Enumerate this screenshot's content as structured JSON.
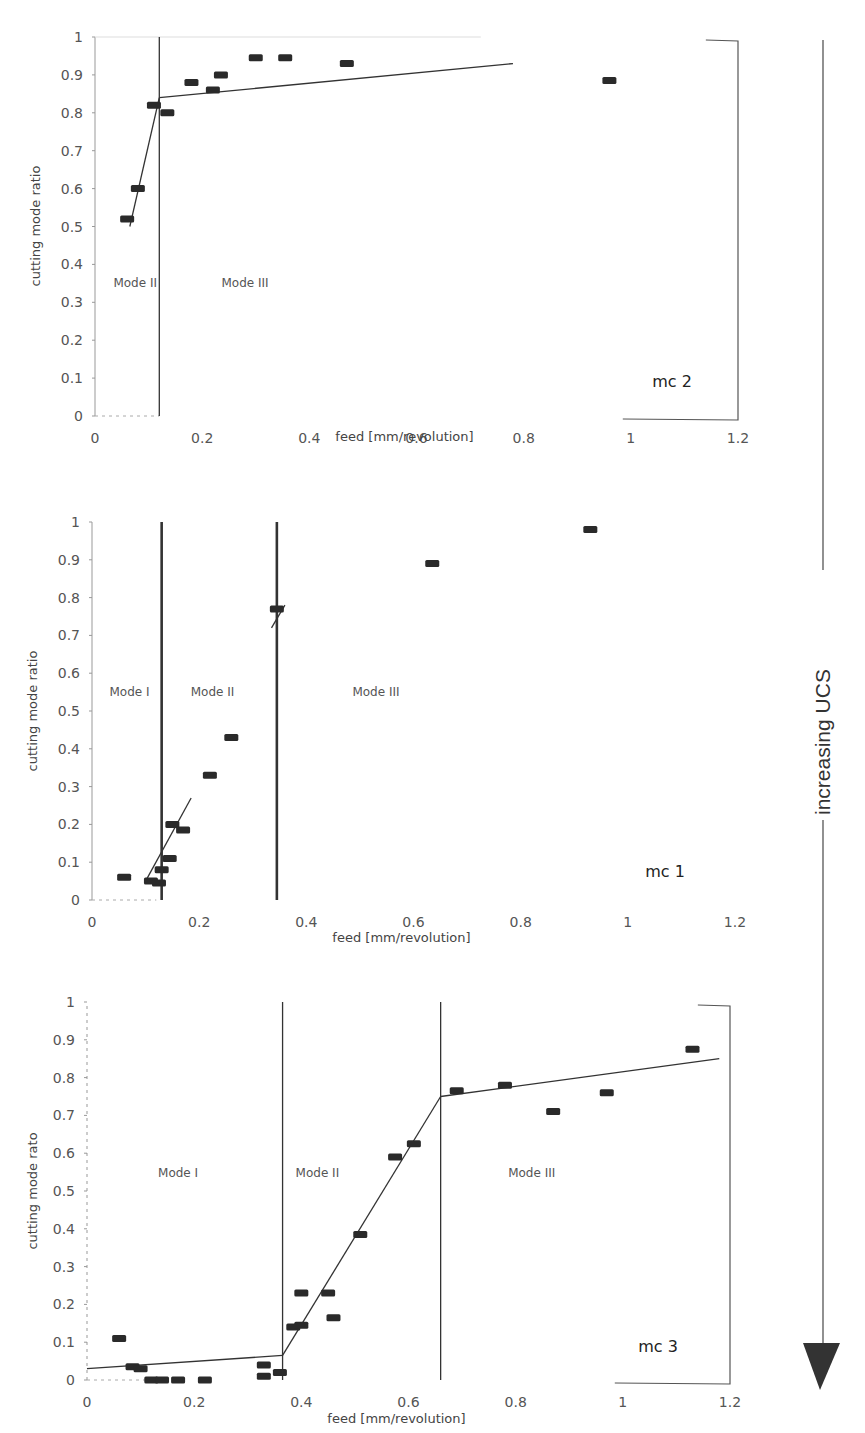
{
  "header_fragment": "... ity ... ing ... y ...",
  "side_arrow": {
    "label": "increasing UCS",
    "direction": "down"
  },
  "chart_data": [
    {
      "id": "mc2",
      "type": "scatter",
      "title": "mc 2",
      "xlabel": "feed [mm/revolution]",
      "ylabel": "cutting mode ratio",
      "xlim": [
        0,
        1.2
      ],
      "ylim": [
        0,
        1
      ],
      "x_ticks": [
        "0",
        "0.2",
        "0.4",
        "0.6",
        "0.8",
        "1",
        "1.2"
      ],
      "y_ticks": [
        "0",
        "0.1",
        "0.2",
        "0.3",
        "0.4",
        "0.5",
        "0.6",
        "0.7",
        "0.8",
        "0.9",
        "1"
      ],
      "grid": false,
      "mode_boundaries": [
        0.12
      ],
      "mode_labels": [
        {
          "text": "Mode II",
          "x": 0.075,
          "y": 0.35
        },
        {
          "text": "Mode III",
          "x": 0.28,
          "y": 0.35
        }
      ],
      "points": [
        {
          "x": 0.06,
          "y": 0.52
        },
        {
          "x": 0.08,
          "y": 0.6
        },
        {
          "x": 0.11,
          "y": 0.82
        },
        {
          "x": 0.135,
          "y": 0.8
        },
        {
          "x": 0.18,
          "y": 0.88
        },
        {
          "x": 0.22,
          "y": 0.86
        },
        {
          "x": 0.235,
          "y": 0.9
        },
        {
          "x": 0.3,
          "y": 0.945
        },
        {
          "x": 0.355,
          "y": 0.945
        },
        {
          "x": 0.47,
          "y": 0.93
        },
        {
          "x": 0.96,
          "y": 0.885
        }
      ],
      "fit_lines": [
        {
          "x": [
            0.065,
            0.12
          ],
          "y": [
            0.5,
            0.84
          ]
        },
        {
          "x": [
            0.12,
            0.78
          ],
          "y": [
            0.84,
            0.93
          ]
        }
      ]
    },
    {
      "id": "mc1",
      "type": "scatter",
      "title": "mc 1",
      "xlabel": "feed [mm/revolution]",
      "ylabel": "cutting mode ratio",
      "xlim": [
        0,
        1.2
      ],
      "ylim": [
        0,
        1
      ],
      "x_ticks": [
        "0",
        "0.2",
        "0.4",
        "0.6",
        "0.8",
        "1",
        "1.2"
      ],
      "y_ticks": [
        "0",
        "0.1",
        "0.2",
        "0.3",
        "0.4",
        "0.5",
        "0.6",
        "0.7",
        "0.8",
        "0.9",
        "1"
      ],
      "grid": false,
      "mode_boundaries": [
        0.13,
        0.345
      ],
      "mode_labels": [
        {
          "text": "Mode I",
          "x": 0.07,
          "y": 0.55
        },
        {
          "text": "Mode II",
          "x": 0.225,
          "y": 0.55
        },
        {
          "text": "Mode III",
          "x": 0.53,
          "y": 0.55
        }
      ],
      "points": [
        {
          "x": 0.06,
          "y": 0.06
        },
        {
          "x": 0.11,
          "y": 0.05
        },
        {
          "x": 0.125,
          "y": 0.045
        },
        {
          "x": 0.13,
          "y": 0.08
        },
        {
          "x": 0.145,
          "y": 0.11
        },
        {
          "x": 0.15,
          "y": 0.2
        },
        {
          "x": 0.17,
          "y": 0.185
        },
        {
          "x": 0.22,
          "y": 0.33
        },
        {
          "x": 0.26,
          "y": 0.43
        },
        {
          "x": 0.345,
          "y": 0.77
        },
        {
          "x": 0.635,
          "y": 0.89
        },
        {
          "x": 0.93,
          "y": 0.98
        }
      ],
      "fit_lines": [
        {
          "x": [
            0.1,
            0.185
          ],
          "y": [
            0.05,
            0.27
          ]
        },
        {
          "x": [
            0.335,
            0.36
          ],
          "y": [
            0.72,
            0.78
          ]
        }
      ]
    },
    {
      "id": "mc3",
      "type": "scatter",
      "title": "mc 3",
      "xlabel": "feed [mm/revolution]",
      "ylabel": "cutting mode rato",
      "xlim": [
        0,
        1.2
      ],
      "ylim": [
        0,
        1
      ],
      "x_ticks": [
        "0",
        "0.2",
        "0.4",
        "0.6",
        "0.8",
        "1",
        "1.2"
      ],
      "y_ticks": [
        "0",
        "0.1",
        "0.2",
        "0.3",
        "0.4",
        "0.5",
        "0.6",
        "0.7",
        "0.8",
        "0.9",
        "1"
      ],
      "grid": false,
      "mode_boundaries": [
        0.365,
        0.66
      ],
      "mode_labels": [
        {
          "text": "Mode I",
          "x": 0.17,
          "y": 0.55
        },
        {
          "text": "Mode II",
          "x": 0.43,
          "y": 0.55
        },
        {
          "text": "Mode III",
          "x": 0.83,
          "y": 0.55
        }
      ],
      "points": [
        {
          "x": 0.06,
          "y": 0.11
        },
        {
          "x": 0.085,
          "y": 0.035
        },
        {
          "x": 0.1,
          "y": 0.03
        },
        {
          "x": 0.12,
          "y": 0.0
        },
        {
          "x": 0.14,
          "y": 0.0
        },
        {
          "x": 0.17,
          "y": 0.0
        },
        {
          "x": 0.22,
          "y": 0.0
        },
        {
          "x": 0.33,
          "y": 0.04
        },
        {
          "x": 0.33,
          "y": 0.01
        },
        {
          "x": 0.36,
          "y": 0.02
        },
        {
          "x": 0.385,
          "y": 0.14
        },
        {
          "x": 0.4,
          "y": 0.145
        },
        {
          "x": 0.4,
          "y": 0.23
        },
        {
          "x": 0.45,
          "y": 0.23
        },
        {
          "x": 0.46,
          "y": 0.165
        },
        {
          "x": 0.51,
          "y": 0.385
        },
        {
          "x": 0.575,
          "y": 0.59
        },
        {
          "x": 0.61,
          "y": 0.625
        },
        {
          "x": 0.69,
          "y": 0.765
        },
        {
          "x": 0.78,
          "y": 0.78
        },
        {
          "x": 0.87,
          "y": 0.71
        },
        {
          "x": 0.97,
          "y": 0.76
        },
        {
          "x": 1.13,
          "y": 0.875
        }
      ],
      "fit_lines": [
        {
          "x": [
            0.0,
            0.365
          ],
          "y": [
            0.03,
            0.065
          ]
        },
        {
          "x": [
            0.365,
            0.66
          ],
          "y": [
            0.065,
            0.75
          ]
        },
        {
          "x": [
            0.66,
            1.18
          ],
          "y": [
            0.75,
            0.85
          ]
        }
      ]
    }
  ],
  "panels": [
    {
      "name": "mc 2"
    },
    {
      "name": "mc 1"
    },
    {
      "name": "mc 3"
    }
  ]
}
